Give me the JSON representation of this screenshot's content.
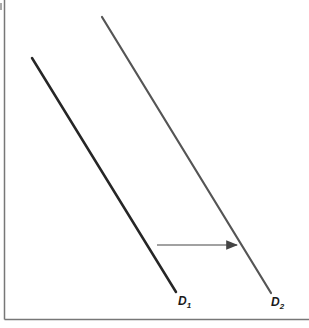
{
  "diagram": {
    "title": "",
    "curves": [
      {
        "id": "D1",
        "label": "D",
        "subscript": "1",
        "color": "#262626"
      },
      {
        "id": "D2",
        "label": "D",
        "subscript": "2",
        "color": "#555555"
      }
    ],
    "shift_arrow": {
      "from": "D1",
      "to": "D2",
      "direction": "right",
      "color": "#444444"
    },
    "axis_color": "#777777"
  }
}
